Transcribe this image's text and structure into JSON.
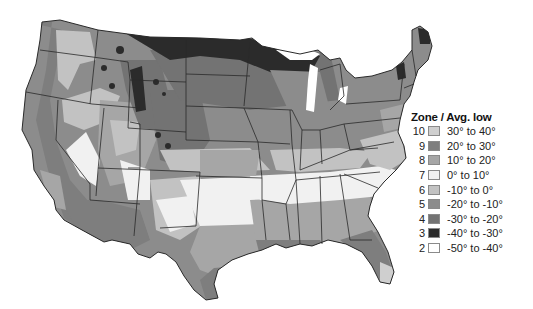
{
  "map": {
    "title": "USDA Plant Hardiness Zones (contiguous United States)",
    "colors": {
      "background": "#ffffff",
      "state_border": "#2a2a2a",
      "water": "#ffffff"
    }
  },
  "legend": {
    "title": "Zone / Avg. low",
    "items": [
      {
        "zone": "10",
        "range": "30° to 40°",
        "color": "#cfcfcf"
      },
      {
        "zone": "9",
        "range": "20° to 30°",
        "color": "#7e7e7e"
      },
      {
        "zone": "8",
        "range": "10° to 20°",
        "color": "#a6a6a6"
      },
      {
        "zone": "7",
        "range": "0° to 10°",
        "color": "#f1f1f1"
      },
      {
        "zone": "6",
        "range": "-10° to 0°",
        "color": "#c2c2c2"
      },
      {
        "zone": "5",
        "range": "-20° to -10°",
        "color": "#8c8c8c"
      },
      {
        "zone": "4",
        "range": "-30° to -20°",
        "color": "#737373"
      },
      {
        "zone": "3",
        "range": "-40° to -30°",
        "color": "#2b2b2b"
      },
      {
        "zone": "2",
        "range": "-50° to -40°",
        "color": "#ffffff"
      }
    ]
  }
}
